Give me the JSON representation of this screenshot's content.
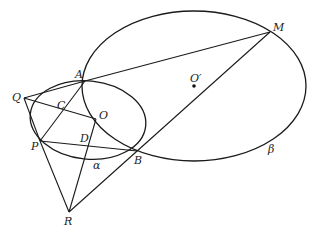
{
  "diagram": {
    "type": "geometry",
    "points": {
      "A": {
        "label": "A",
        "x": 85,
        "y": 81
      },
      "Q": {
        "label": "Q",
        "x": 24,
        "y": 98
      },
      "C": {
        "label": "C",
        "x": 62,
        "y": 109
      },
      "O": {
        "label": "O",
        "x": 96,
        "y": 119
      },
      "P": {
        "label": "P",
        "x": 40,
        "y": 141
      },
      "D": {
        "label": "D",
        "x": 89,
        "y": 140
      },
      "B": {
        "label": "B",
        "x": 137,
        "y": 151
      },
      "R": {
        "label": "R",
        "x": 69,
        "y": 212
      },
      "M": {
        "label": "M",
        "x": 270,
        "y": 32
      },
      "O_prime": {
        "label": "O′",
        "x": 194,
        "y": 86
      }
    },
    "curves": {
      "alpha": {
        "label": "α",
        "cx": 88,
        "cy": 120,
        "rx": 58,
        "ry": 40
      },
      "beta": {
        "label": "β",
        "cx": 194,
        "cy": 86,
        "rx": 112,
        "ry": 75
      }
    },
    "segments": [
      "QA",
      "QO",
      "QP",
      "AP",
      "AM",
      "MR",
      "PB",
      "PR",
      "OR"
    ]
  }
}
